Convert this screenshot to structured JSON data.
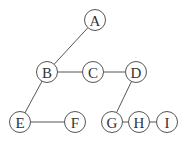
{
  "diagram": {
    "type": "graph",
    "nodes": [
      {
        "id": "A",
        "label": "A",
        "x": 95,
        "y": 20
      },
      {
        "id": "B",
        "label": "B",
        "x": 47,
        "y": 72
      },
      {
        "id": "C",
        "label": "C",
        "x": 93,
        "y": 72
      },
      {
        "id": "D",
        "label": "D",
        "x": 136,
        "y": 72
      },
      {
        "id": "E",
        "label": "E",
        "x": 20,
        "y": 122
      },
      {
        "id": "F",
        "label": "F",
        "x": 75,
        "y": 122
      },
      {
        "id": "G",
        "label": "G",
        "x": 112,
        "y": 122
      },
      {
        "id": "H",
        "label": "H",
        "x": 139,
        "y": 122
      },
      {
        "id": "I",
        "label": "I",
        "x": 167,
        "y": 122
      }
    ],
    "edges": [
      [
        "A",
        "B"
      ],
      [
        "B",
        "C"
      ],
      [
        "C",
        "D"
      ],
      [
        "B",
        "E"
      ],
      [
        "E",
        "F"
      ],
      [
        "D",
        "G"
      ],
      [
        "G",
        "H"
      ],
      [
        "H",
        "I"
      ]
    ]
  }
}
